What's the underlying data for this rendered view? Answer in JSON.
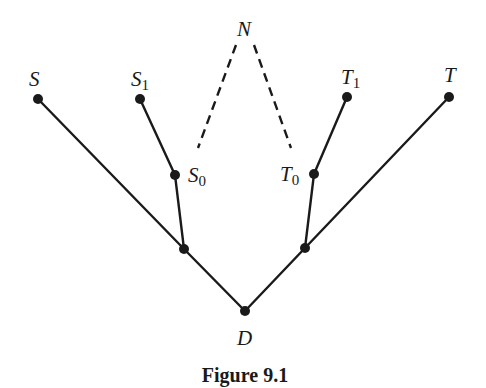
{
  "figure": {
    "caption": "Figure 9.1"
  },
  "nodes": {
    "S": {
      "label": "S",
      "sub": "",
      "x": 38,
      "y": 99
    },
    "S1": {
      "label": "S",
      "sub": "1",
      "x": 140,
      "y": 99
    },
    "S0": {
      "label": "S",
      "sub": "0",
      "x": 175,
      "y": 175
    },
    "JL": {
      "label": "",
      "sub": "",
      "x": 184,
      "y": 249
    },
    "N": {
      "label": "N",
      "sub": "",
      "x": 245,
      "y": 28
    },
    "T0": {
      "label": "T",
      "sub": "0",
      "x": 314,
      "y": 174
    },
    "T1": {
      "label": "T",
      "sub": "1",
      "x": 347,
      "y": 97
    },
    "T": {
      "label": "T",
      "sub": "",
      "x": 449,
      "y": 97
    },
    "JR": {
      "label": "",
      "sub": "",
      "x": 305,
      "y": 248
    },
    "D": {
      "label": "D",
      "sub": "",
      "x": 245,
      "y": 311
    }
  },
  "edges": [
    {
      "from": "S",
      "to": "JL",
      "style": "solid"
    },
    {
      "from": "S1",
      "to": "S0",
      "style": "solid"
    },
    {
      "from": "S0",
      "to": "JL",
      "style": "solid"
    },
    {
      "from": "JL",
      "to": "D",
      "style": "solid"
    },
    {
      "from": "T",
      "to": "JR",
      "style": "solid"
    },
    {
      "from": "T1",
      "to": "T0",
      "style": "solid"
    },
    {
      "from": "T0",
      "to": "JR",
      "style": "solid"
    },
    {
      "from": "JR",
      "to": "D",
      "style": "solid"
    },
    {
      "from": "N",
      "to": "S0",
      "style": "dashed"
    },
    {
      "from": "N",
      "to": "T0",
      "style": "dashed"
    }
  ]
}
